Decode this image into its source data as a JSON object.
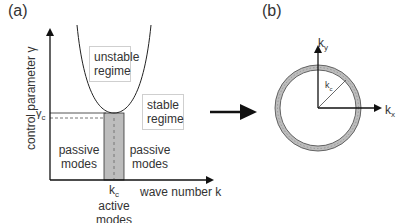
{
  "panel_a": {
    "label": "(a)",
    "y_axis_label": "control parameter γ",
    "x_axis_label": "wave number k",
    "critical_gamma_label": "γ",
    "critical_gamma_sub": "c",
    "critical_k_label": "k",
    "critical_k_sub": "c",
    "unstable_box": {
      "line1": "unstable",
      "line2": "regime"
    },
    "stable_box": {
      "line1": "stable",
      "line2": "regime"
    },
    "passive_left": {
      "line1": "passive",
      "line2": "modes"
    },
    "passive_right": {
      "line1": "passive",
      "line2": "modes"
    },
    "active": {
      "line1": "active",
      "line2": "modes"
    }
  },
  "panel_b": {
    "label": "(b)",
    "ky_label": "k",
    "ky_sub": "y",
    "kx_label": "k",
    "kx_sub": "x",
    "radius_label": "k",
    "radius_sub": "c"
  },
  "colors": {
    "line": "#222222",
    "band_fill": "#bdbdbd",
    "box_border": "#cfcfcf"
  }
}
